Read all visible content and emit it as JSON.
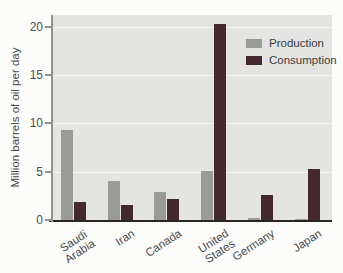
{
  "chart_data": {
    "type": "bar",
    "categories": [
      "Saudi Arabia",
      "Iran",
      "Canada",
      "United States",
      "Germany",
      "Japan"
    ],
    "category_display_lines": [
      [
        "Saudi",
        "Arabia"
      ],
      [
        "Iran"
      ],
      [
        "Canada"
      ],
      [
        "United",
        "States"
      ],
      [
        "Germany"
      ],
      [
        "Japan"
      ]
    ],
    "series": [
      {
        "name": "Production",
        "color": "#9a9b97",
        "values": [
          9.3,
          4.0,
          2.9,
          5.1,
          0.2,
          0.1
        ]
      },
      {
        "name": "Consumption",
        "color": "#43292e",
        "values": [
          1.9,
          1.5,
          2.2,
          20.3,
          2.6,
          5.3
        ]
      }
    ],
    "title": "",
    "xlabel": "",
    "ylabel": "Million barrels of oil per day",
    "yticks": [
      0,
      5,
      10,
      15,
      20
    ],
    "ylim": [
      0,
      21.2
    ],
    "grid": "horizontal white gridlines at y ticks",
    "legend_position": "upper-right inside plot"
  },
  "legend": {
    "production_label": "Production",
    "consumption_label": "Consumption"
  },
  "axis": {
    "ylabel": "Million barrels of oil per day"
  },
  "colors": {
    "plot_background": "#e4e5e2",
    "page_background": "#fcfcfa",
    "gridline": "#f6f6f3",
    "x_axis_line": "#2a2425",
    "y_axis_line": "#929290",
    "tick_text": "#4e4e52",
    "production_bar": "#9a9b97",
    "consumption_bar": "#43292e"
  }
}
